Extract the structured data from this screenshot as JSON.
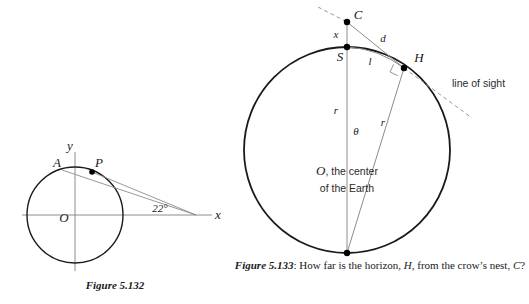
{
  "figures": {
    "left": {
      "caption_label": "Figure 5.132",
      "axes": {
        "x_label": "x",
        "y_label": "y"
      },
      "points": [
        {
          "id": "A",
          "label": "A"
        },
        {
          "id": "P",
          "label": "P"
        },
        {
          "id": "O",
          "label": "O"
        }
      ],
      "angle": {
        "label": "22°",
        "value": 22,
        "unit": "degrees"
      },
      "geometry": {
        "center_x": 75,
        "center_y": 215,
        "radius": 48,
        "x_axis_start": 22,
        "x_axis_end": 212,
        "y_axis_top": 152,
        "y_axis_bottom": 271,
        "point_A_x": 62,
        "point_A_y": 170,
        "point_P_x": 92,
        "point_P_y": 172,
        "apex_x": 196,
        "apex_y": 215
      },
      "colors": {
        "circle": "#1a1a1a",
        "axis": "#8c8c8c",
        "ray": "#8c8c8c",
        "dot": "#000000"
      }
    },
    "right": {
      "caption_prefix": "Figure 5.133",
      "caption_sep": ":",
      "caption_text_1": "How far is the horizon,",
      "caption_var_1": "H",
      "caption_text_2": ", from the crow’s",
      "caption_text_3": "nest,",
      "caption_var_2": "C",
      "caption_text_4": "?",
      "points": [
        {
          "id": "C",
          "label": "C"
        },
        {
          "id": "S",
          "label": "S"
        },
        {
          "id": "H",
          "label": "H"
        },
        {
          "id": "O",
          "label": "O"
        }
      ],
      "segments": [
        {
          "id": "x",
          "label": "x"
        },
        {
          "id": "d",
          "label": "d"
        },
        {
          "id": "l",
          "label": "l"
        },
        {
          "id": "r_vertical",
          "label": "r"
        },
        {
          "id": "r_radial",
          "label": "r"
        }
      ],
      "angle": {
        "label": "θ"
      },
      "annotations": {
        "line_of_sight": "line of sight",
        "center_line_1": "O",
        "center_line_1_rest": ", the center",
        "center_line_2": "of the Earth"
      },
      "geometry": {
        "center_x": 347,
        "center_y": 150,
        "radius": 103,
        "point_C_x": 347,
        "point_C_y": 22,
        "point_S_x": 347,
        "point_S_y": 47,
        "point_H_x": 404,
        "point_H_y": 68,
        "dash_up_x": 318,
        "dash_up_y": 7,
        "dash_down_x": 472,
        "dash_down_y": 118
      },
      "colors": {
        "circle": "#1a1a1a",
        "line": "#8c8c8c",
        "dash": "#9a9a9a",
        "dot": "#000000"
      }
    }
  }
}
